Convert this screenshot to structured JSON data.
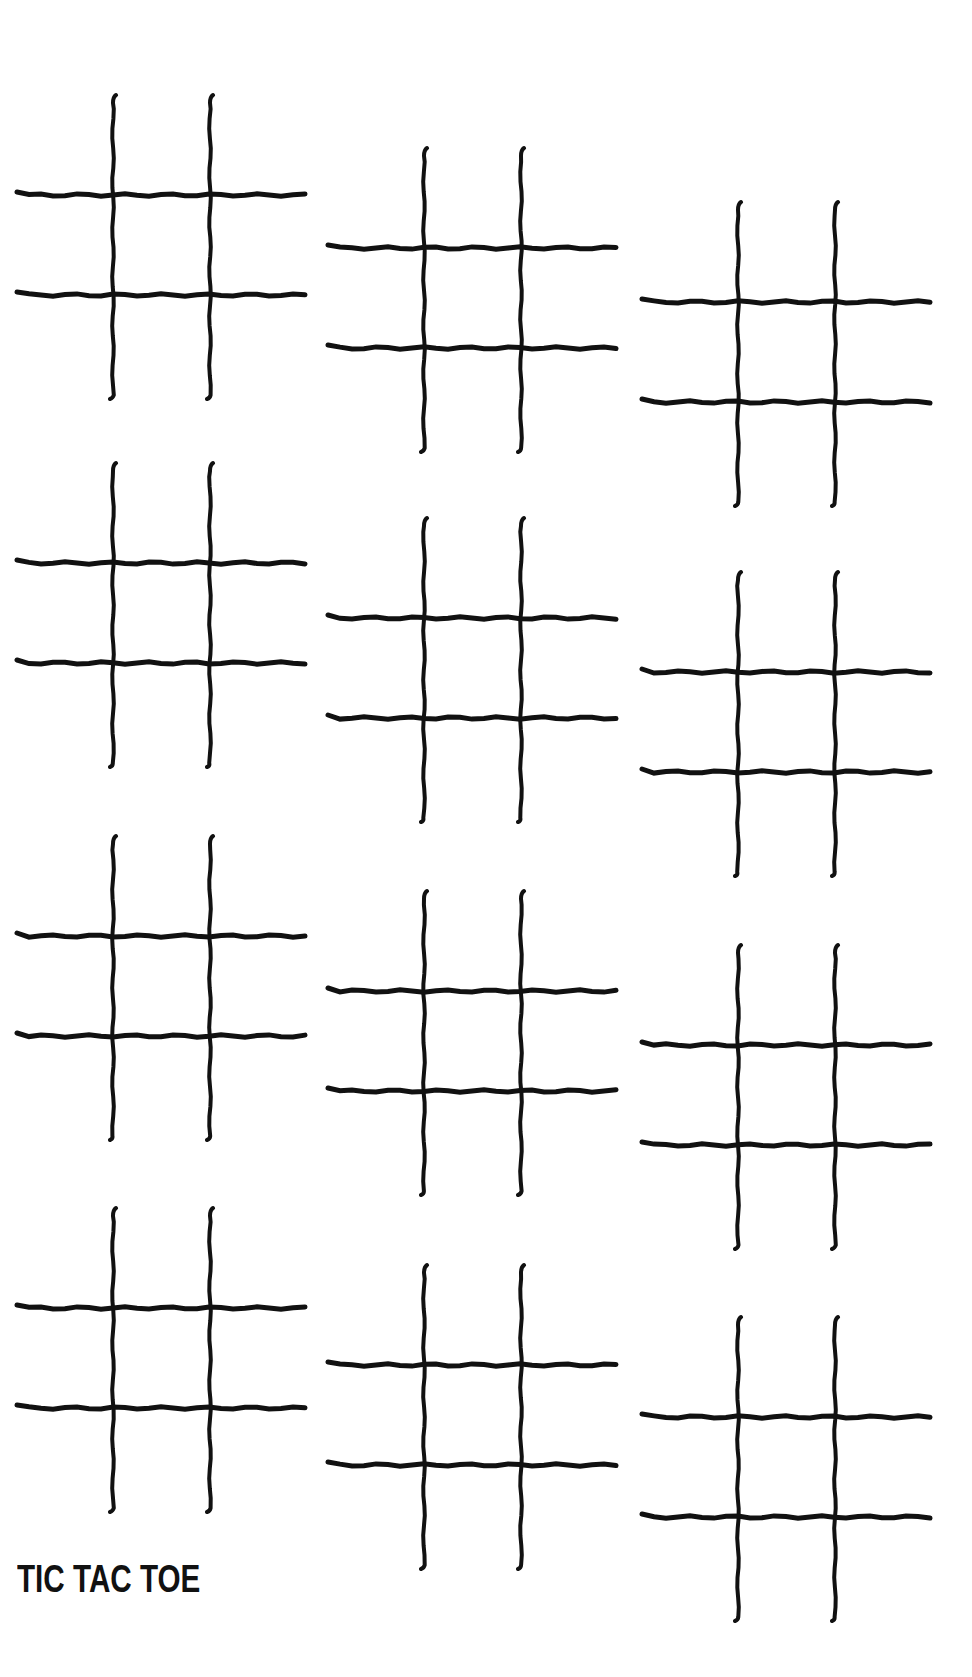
{
  "title": "TIC TAC TOE",
  "colors": {
    "background": "#ffffff",
    "ink": "#111111"
  },
  "boards": [
    {
      "id": 1,
      "col": 1,
      "row": 1,
      "x": 17,
      "y": 99
    },
    {
      "id": 2,
      "col": 2,
      "row": 1,
      "x": 328,
      "y": 152
    },
    {
      "id": 3,
      "col": 3,
      "row": 1,
      "x": 642,
      "y": 206
    },
    {
      "id": 4,
      "col": 1,
      "row": 2,
      "x": 17,
      "y": 467
    },
    {
      "id": 5,
      "col": 2,
      "row": 2,
      "x": 328,
      "y": 522
    },
    {
      "id": 6,
      "col": 3,
      "row": 2,
      "x": 642,
      "y": 576
    },
    {
      "id": 7,
      "col": 1,
      "row": 3,
      "x": 17,
      "y": 840
    },
    {
      "id": 8,
      "col": 2,
      "row": 3,
      "x": 328,
      "y": 895
    },
    {
      "id": 9,
      "col": 3,
      "row": 3,
      "x": 642,
      "y": 949
    },
    {
      "id": 10,
      "col": 1,
      "row": 4,
      "x": 17,
      "y": 1212
    },
    {
      "id": 11,
      "col": 2,
      "row": 4,
      "x": 328,
      "y": 1269
    },
    {
      "id": 12,
      "col": 3,
      "row": 4,
      "x": 642,
      "y": 1321
    }
  ]
}
